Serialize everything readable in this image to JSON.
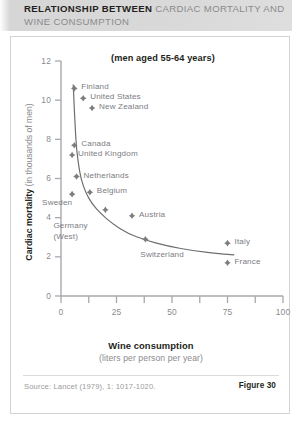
{
  "title": {
    "strong": "RELATIONSHIP BETWEEN",
    "light": "CARDIAC MORTALITY AND WINE CONSUMPTION"
  },
  "figure": {
    "source": "Source: Lancet (1979), 1: 1017-1020.",
    "number_label": "Figure 30"
  },
  "axis": {
    "y_title_strong": "Cardiac mortality",
    "y_title_light": "(in thousands of men)",
    "x_title_strong": "Wine consumption",
    "x_title_light": "(liters per person per year)"
  },
  "colors": {
    "marker": "#7d7d80",
    "curve": "#6e6e71",
    "axis": "#a9a9ac",
    "title_strong": "#231f20",
    "title_light": "#8a8a8d",
    "banner": "#d8d8d8"
  },
  "chart_data": {
    "type": "scatter",
    "title": "RELATIONSHIP BETWEEN CARDIAC MORTALITY AND WINE CONSUMPTION",
    "annotation": "(men aged 55-64 years)",
    "xlabel": "Wine consumption (liters per person per year)",
    "ylabel": "Cardiac mortality (in thousands of men)",
    "xlim": [
      0,
      100
    ],
    "ylim": [
      0,
      12
    ],
    "xticks": [
      0,
      25,
      50,
      75,
      100
    ],
    "yticks": [
      0,
      2,
      4,
      6,
      8,
      10,
      12
    ],
    "xminor_ticks": [
      12.5,
      37.5,
      62.5,
      87.5
    ],
    "grid": false,
    "legend": "none",
    "points": [
      {
        "name": "Finland",
        "x": 6,
        "y": 10.6,
        "label_dx": 7,
        "label_dy": -3
      },
      {
        "name": "United States",
        "x": 10,
        "y": 10.1,
        "label_dx": 7,
        "label_dy": -3
      },
      {
        "name": "New Zealand",
        "x": 14,
        "y": 9.6,
        "label_dx": 7,
        "label_dy": -3
      },
      {
        "name": "Canada",
        "x": 6,
        "y": 7.7,
        "label_dx": 7,
        "label_dy": -3
      },
      {
        "name": "United Kingdom",
        "x": 5,
        "y": 7.2,
        "label_dx": 6,
        "label_dy": -3
      },
      {
        "name": "Netherlands",
        "x": 7,
        "y": 6.1,
        "label_dx": 7,
        "label_dy": -3
      },
      {
        "name": "Belgium",
        "x": 13,
        "y": 5.3,
        "label_dx": 7,
        "label_dy": -3
      },
      {
        "name": "Sweden",
        "x": 5,
        "y": 5.2,
        "label_dx": -30,
        "label_dy": 7
      },
      {
        "name": "Germany (West)",
        "x": 20,
        "y": 4.4,
        "label_dx": -52,
        "label_dy": 14
      },
      {
        "name": "Austria",
        "x": 32,
        "y": 4.1,
        "label_dx": 7,
        "label_dy": -3
      },
      {
        "name": "Switzerland",
        "x": 38,
        "y": 2.9,
        "label_dx": -5,
        "label_dy": 14
      },
      {
        "name": "Italy",
        "x": 75,
        "y": 2.7,
        "label_dx": 7,
        "label_dy": -3
      },
      {
        "name": "France",
        "x": 75,
        "y": 1.7,
        "label_dx": 7,
        "label_dy": -3
      }
    ],
    "fit_curve": {
      "description": "decreasing power/exponential fit through the scatter",
      "points": [
        [
          5.5,
          10.8
        ],
        [
          6,
          9.5
        ],
        [
          6.5,
          8.4
        ],
        [
          7,
          7.5
        ],
        [
          8,
          6.6
        ],
        [
          9,
          6.0
        ],
        [
          11,
          5.3
        ],
        [
          14,
          4.7
        ],
        [
          18,
          4.2
        ],
        [
          23,
          3.7
        ],
        [
          30,
          3.2
        ],
        [
          38,
          2.85
        ],
        [
          48,
          2.55
        ],
        [
          60,
          2.3
        ],
        [
          72,
          2.15
        ],
        [
          78,
          2.1
        ]
      ]
    }
  }
}
